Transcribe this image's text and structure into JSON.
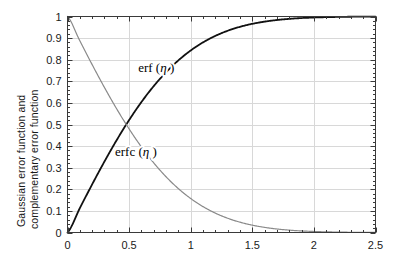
{
  "figure": {
    "background_color": "#ffffff",
    "plot_frame_color": "#3a3a3a",
    "grid_color": "#d8d8d8"
  },
  "axis_label": {
    "y_line_1": "Gaussian error function and",
    "y_line_2": "complementary error function",
    "x_title": ""
  },
  "chart_data": {
    "type": "line",
    "title": "",
    "xlabel": "",
    "ylabel": "Gaussian error function and complementary error function",
    "xlim": [
      0,
      2.5
    ],
    "ylim": [
      0,
      1
    ],
    "grid": true,
    "legend": "inline-labels",
    "x_ticks": [
      "0",
      "0.5",
      "1",
      "1.5",
      "2",
      "2.5"
    ],
    "x_tick_values": [
      0,
      0.5,
      1,
      1.5,
      2,
      2.5
    ],
    "x_minor_tick_step": 0.1,
    "y_ticks": [
      "0",
      "0.1",
      "0.2",
      "0.3",
      "0.4",
      "0.5",
      "0.6",
      "0.7",
      "0.8",
      "0.9",
      "1"
    ],
    "y_tick_values": [
      0,
      0.1,
      0.2,
      0.3,
      0.4,
      0.5,
      0.6,
      0.7,
      0.8,
      0.9,
      1
    ],
    "y_minor_tick_step": 0.02,
    "x": [
      0,
      0.1,
      0.2,
      0.3,
      0.4,
      0.5,
      0.6,
      0.7,
      0.8,
      0.9,
      1.0,
      1.1,
      1.2,
      1.3,
      1.4,
      1.5,
      1.6,
      1.7,
      1.8,
      1.9,
      2.0,
      2.1,
      2.2,
      2.3,
      2.4,
      2.5
    ],
    "series": [
      {
        "name": "erf",
        "label_text": "erf",
        "label_arg": "(η)",
        "color": "#111111",
        "line_width": 1.8,
        "label_x": 0.72,
        "label_y": 0.745,
        "values": [
          0.0,
          0.1125,
          0.2227,
          0.3286,
          0.4284,
          0.5205,
          0.6039,
          0.6778,
          0.7421,
          0.7969,
          0.8427,
          0.8802,
          0.9103,
          0.934,
          0.9523,
          0.9661,
          0.9763,
          0.9838,
          0.9891,
          0.9928,
          0.9953,
          0.997,
          0.9981,
          0.9989,
          0.9993,
          0.9996
        ]
      },
      {
        "name": "erfc",
        "label_text": "erfc",
        "label_arg": "(η)",
        "color": "#8a8a8a",
        "line_width": 1.2,
        "label_x": 0.555,
        "label_y": 0.355,
        "values": [
          1.0,
          0.8875,
          0.7773,
          0.6714,
          0.5716,
          0.4795,
          0.3961,
          0.3222,
          0.2579,
          0.2031,
          0.1573,
          0.1198,
          0.0897,
          0.066,
          0.0477,
          0.0339,
          0.0237,
          0.0162,
          0.0109,
          0.0072,
          0.0047,
          0.003,
          0.0019,
          0.0011,
          0.0007,
          0.0004
        ]
      }
    ],
    "intersection": {
      "x": 0.4769,
      "y": 0.5
    }
  }
}
